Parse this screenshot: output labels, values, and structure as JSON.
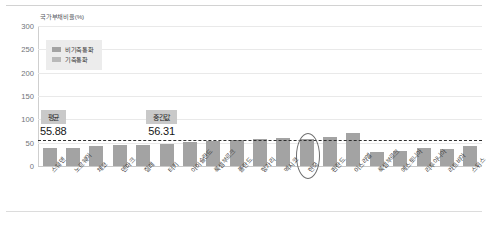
{
  "chart_data": {
    "type": "bar",
    "title": "",
    "ylabel": "국가부채비율(%)",
    "xlabel": "",
    "ylim": [
      0,
      300
    ],
    "yticks": [
      0,
      50,
      100,
      150,
      200,
      250,
      300
    ],
    "grid": true,
    "legend_position": "top-left",
    "legend": [
      "비기축통화",
      "기축통화"
    ],
    "categories": [
      "스웨덴",
      "노르웨이",
      "체코",
      "덴마크",
      "칠레",
      "터키",
      "아이슬란드",
      "룩셈부르크",
      "폴란드",
      "헝가리",
      "멕시코",
      "한국",
      "핀란드",
      "이스라엘",
      "룩셈부르크",
      "에스토니아",
      "리투아니아",
      "라트비아",
      "스위스"
    ],
    "values": [
      38.0,
      39.2,
      42.0,
      44.5,
      46.0,
      48.0,
      52.0,
      54.5,
      56.0,
      57.5,
      59.0,
      57.0,
      62.0,
      71.0,
      31.0,
      33.0,
      38.0,
      37.0,
      42.0
    ],
    "series": [
      {
        "name": "비기축통화",
        "color": "#a3a3a3",
        "values": [
          38.0,
          39.2,
          42.0,
          44.5,
          46.0,
          48.0,
          52.0,
          54.5,
          56.0,
          57.5,
          59.0,
          57.0,
          62.0,
          71.0,
          31.0,
          33.0,
          38.0,
          37.0,
          42.0
        ]
      }
    ],
    "reference_lines": [
      {
        "label": "중간값",
        "value": 56.31,
        "style": "dashed",
        "color": "#2f2f2f"
      }
    ],
    "annotations": [
      {
        "name": "평균",
        "label": "평균",
        "value": "55.88"
      },
      {
        "name": "중간값",
        "label": "중간값",
        "value": "56.31"
      }
    ],
    "highlight": {
      "category": "한국",
      "shape": "ellipse"
    }
  },
  "axis": {
    "y_title": "국가부채비율(%)",
    "ticks": [
      "300",
      "250",
      "200",
      "150",
      "100",
      "50",
      "0"
    ]
  },
  "legend": {
    "items": [
      {
        "label": "비기축통화",
        "color": "#a3a3a3"
      },
      {
        "label": "기축통화",
        "color": "#b9b9b9"
      }
    ]
  },
  "callouts": {
    "average": {
      "tag": "평균",
      "value": "55.88"
    },
    "median": {
      "tag": "중간값",
      "value": "56.31"
    }
  },
  "xlabels": [
    "스웨덴",
    "노르웨이",
    "체코",
    "덴마크",
    "칠레",
    "터키",
    "아이슬란드",
    "룩셈부르크",
    "폴란드",
    "헝가리",
    "멕시코",
    "한국",
    "핀란드",
    "이스라엘",
    "룩셈부르크",
    "에스토니아",
    "리투아니아",
    "라트비아",
    "스위스"
  ]
}
